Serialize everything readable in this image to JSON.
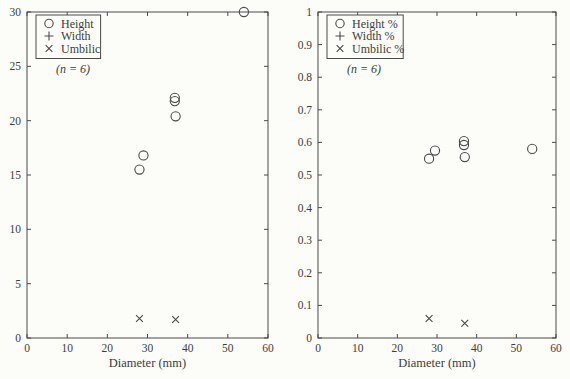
{
  "figure": {
    "background": "#fcfcf9",
    "ink_color": "#4a4a4a",
    "text_color": "#3d3d3d",
    "marker_color": "#4a4a4a"
  },
  "chart_data": [
    {
      "id": "left-plot",
      "type": "scatter",
      "title": "",
      "xlabel": "Diameter (mm)",
      "ylabel": "",
      "xlim": [
        0,
        60
      ],
      "ylim": [
        0,
        30
      ],
      "xticks": [
        "0",
        "10",
        "20",
        "30",
        "40",
        "50",
        "60"
      ],
      "yticks": [
        "0",
        "5",
        "10",
        "15",
        "20",
        "25",
        "30"
      ],
      "grid": false,
      "legend_position": "top-left",
      "annotation": "(n = 6)",
      "series": [
        {
          "name": "Height",
          "marker": "circle",
          "points": [
            [
              28,
              15.5
            ],
            [
              29,
              16.8
            ],
            [
              37,
              20.4
            ],
            [
              36.8,
              21.8
            ],
            [
              36.8,
              22.1
            ],
            [
              54,
              30
            ]
          ]
        },
        {
          "name": "Width",
          "marker": "plus",
          "points": []
        },
        {
          "name": "Umbilic",
          "marker": "cross",
          "points": [
            [
              28,
              1.8
            ],
            [
              37,
              1.7
            ]
          ]
        }
      ]
    },
    {
      "id": "right-plot",
      "type": "scatter",
      "title": "",
      "xlabel": "Diameter (mm)",
      "ylabel": "",
      "xlim": [
        0,
        60
      ],
      "ylim": [
        0,
        1
      ],
      "xticks": [
        "0",
        "10",
        "20",
        "30",
        "40",
        "50",
        "60"
      ],
      "yticks": [
        "0",
        "0.1",
        "0.2",
        "0.3",
        "0.4",
        "0.5",
        "0.6",
        "0.7",
        "0.8",
        "0.9",
        "1"
      ],
      "grid": false,
      "legend_position": "top-left",
      "annotation": "(n = 6)",
      "series": [
        {
          "name": "Height %",
          "marker": "circle",
          "points": [
            [
              28,
              0.55
            ],
            [
              29.5,
              0.575
            ],
            [
              37,
              0.555
            ],
            [
              36.8,
              0.592
            ],
            [
              36.8,
              0.604
            ],
            [
              54,
              0.58
            ]
          ]
        },
        {
          "name": "Width %",
          "marker": "plus",
          "points": []
        },
        {
          "name": "Umbilic %",
          "marker": "cross",
          "points": [
            [
              28,
              0.06
            ],
            [
              37,
              0.045
            ]
          ]
        }
      ]
    }
  ]
}
